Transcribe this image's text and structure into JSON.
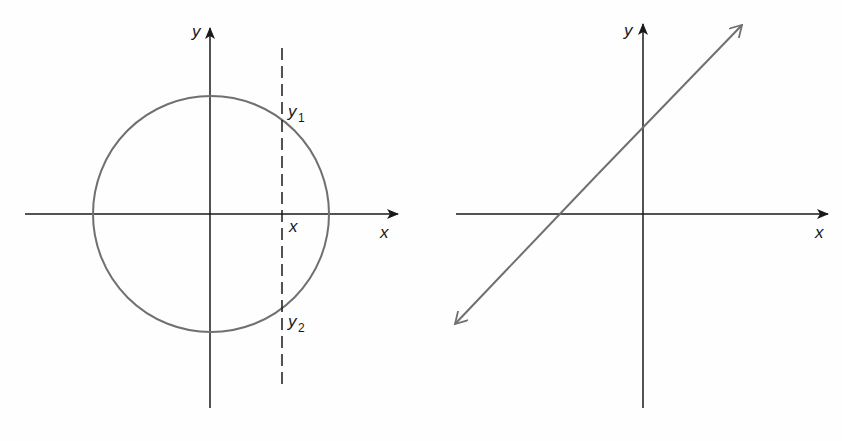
{
  "left_figure": {
    "description": "Circle centered at origin with vertical dashed line at x intersecting circle at y1 and y2",
    "axis_labels": {
      "x": "x",
      "y": "y"
    },
    "point_labels": {
      "x_intercept": "x",
      "y1": {
        "base": "y",
        "sub": "1"
      },
      "y2": {
        "base": "y",
        "sub": "2"
      }
    },
    "colors": {
      "axis": "#1a1a1a",
      "curve": "#707070"
    }
  },
  "right_figure": {
    "description": "Straight line with arrows at both ends crossing both axes",
    "axis_labels": {
      "x": "x",
      "y": "y"
    },
    "colors": {
      "axis": "#1a1a1a",
      "line": "#707070"
    }
  }
}
